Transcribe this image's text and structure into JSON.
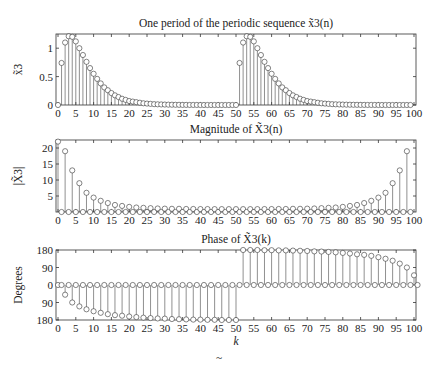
{
  "chart_data": [
    {
      "type": "stem",
      "title": "One period of the periodic sequence x̃3(n)",
      "xlabel": "",
      "ylabel": "x̃3",
      "xlim": [
        0,
        100
      ],
      "ylim": [
        0,
        1.25
      ],
      "xticks": [
        0,
        5,
        10,
        15,
        20,
        25,
        30,
        35,
        40,
        45,
        50,
        55,
        60,
        65,
        70,
        75,
        80,
        85,
        90,
        95,
        100
      ],
      "yticks": [
        {
          "v": 0,
          "label": "0"
        },
        {
          "v": 0.5,
          "label": "0.5"
        },
        {
          "v": 1,
          "label": "1"
        }
      ],
      "x_range": [
        0,
        99
      ],
      "values": [
        0,
        0.74,
        1.1,
        1.21,
        1.2,
        1.12,
        1.0,
        0.88,
        0.76,
        0.65,
        0.55,
        0.46,
        0.38,
        0.31,
        0.26,
        0.21,
        0.17,
        0.14,
        0.11,
        0.09,
        0.07,
        0.06,
        0.05,
        0.04,
        0.03,
        0.025,
        0.02,
        0.015,
        0.012,
        0.01,
        0.008,
        0.006,
        0.005,
        0.004,
        0.003,
        0.002,
        0.002,
        0.001,
        0.001,
        0.001,
        0,
        0,
        0,
        0,
        0,
        0,
        0,
        0,
        0,
        0,
        0,
        0.74,
        1.1,
        1.21,
        1.2,
        1.12,
        1.0,
        0.88,
        0.76,
        0.65,
        0.55,
        0.46,
        0.38,
        0.31,
        0.26,
        0.21,
        0.17,
        0.14,
        0.11,
        0.09,
        0.07,
        0.06,
        0.05,
        0.04,
        0.03,
        0.025,
        0.02,
        0.015,
        0.012,
        0.01,
        0.008,
        0.006,
        0.005,
        0.004,
        0.003,
        0.002,
        0.002,
        0.001,
        0.001,
        0.001,
        0,
        0,
        0,
        0,
        0,
        0,
        0,
        0,
        0,
        0
      ],
      "grid": false
    },
    {
      "type": "stem",
      "title": "Magnitude of X̃3(n)",
      "xlabel": "",
      "ylabel": "|X̃3|",
      "xlim": [
        0,
        100
      ],
      "ylim": [
        0,
        22.5
      ],
      "xticks": [
        0,
        5,
        10,
        15,
        20,
        25,
        30,
        35,
        40,
        45,
        50,
        55,
        60,
        65,
        70,
        75,
        80,
        85,
        90,
        95,
        100
      ],
      "yticks": [
        {
          "v": 5,
          "label": "5"
        },
        {
          "v": 10,
          "label": "10"
        },
        {
          "v": 15,
          "label": "15"
        },
        {
          "v": 20,
          "label": "20"
        }
      ],
      "x_range": [
        0,
        99
      ],
      "values": [
        22,
        0,
        19,
        0,
        13,
        0,
        9,
        0,
        6,
        0,
        4.5,
        0,
        3.5,
        0,
        2.8,
        0,
        2.2,
        0,
        1.9,
        0,
        1.6,
        0,
        1.4,
        0,
        1.3,
        0,
        1.2,
        0,
        1.1,
        0,
        1.05,
        0,
        1.0,
        0,
        1.0,
        0,
        0.95,
        0,
        0.95,
        0,
        0.92,
        0,
        0.92,
        0,
        0.9,
        0,
        0.9,
        0,
        0.9,
        0,
        0.9,
        0,
        0.9,
        0,
        0.9,
        0,
        0.9,
        0,
        0.92,
        0,
        0.92,
        0,
        0.95,
        0,
        0.95,
        0,
        1.0,
        0,
        1.0,
        0,
        1.05,
        0,
        1.1,
        0,
        1.2,
        0,
        1.3,
        0,
        1.4,
        0,
        1.6,
        0,
        1.9,
        0,
        2.2,
        0,
        2.8,
        0,
        3.5,
        0,
        4.5,
        0,
        6,
        0,
        9,
        0,
        13,
        0,
        19,
        0
      ],
      "grid": false
    },
    {
      "type": "stem",
      "title": "Phase of X̃3(k)",
      "xlabel": "k",
      "ylabel": "Degrees",
      "xlim": [
        0,
        100
      ],
      "ylim": [
        -180,
        180
      ],
      "xticks": [
        0,
        5,
        10,
        15,
        20,
        25,
        30,
        35,
        40,
        45,
        50,
        55,
        60,
        65,
        70,
        75,
        80,
        85,
        90,
        95,
        100
      ],
      "yticks": [
        {
          "v": 180,
          "label": "180"
        },
        {
          "v": 90,
          "label": "90"
        },
        {
          "v": 0,
          "label": "0"
        },
        {
          "v": -90,
          "label": "90"
        },
        {
          "v": -180,
          "label": "180"
        }
      ],
      "x_range": [
        0,
        99
      ],
      "values": [
        0,
        0,
        -50,
        0,
        -90,
        0,
        -110,
        0,
        -125,
        0,
        -135,
        0,
        -143,
        0,
        -150,
        0,
        -155,
        0,
        -158,
        0,
        -162,
        0,
        -165,
        0,
        -168,
        0,
        -170,
        0,
        -172,
        0,
        -173,
        0,
        -175,
        0,
        -176,
        0,
        -177,
        0,
        -178,
        0,
        -178,
        0,
        -179,
        0,
        -179,
        0,
        -180,
        0,
        -180,
        0,
        -180,
        0,
        180,
        0,
        180,
        0,
        180,
        0,
        179,
        0,
        179,
        0,
        178,
        0,
        178,
        0,
        177,
        0,
        176,
        0,
        175,
        0,
        173,
        0,
        172,
        0,
        170,
        0,
        168,
        0,
        165,
        0,
        162,
        0,
        158,
        0,
        155,
        0,
        150,
        0,
        143,
        0,
        135,
        0,
        125,
        0,
        110,
        0,
        90,
        0,
        50,
        0
      ],
      "grid": false
    }
  ],
  "figure": {
    "caption_glyph": "~"
  }
}
